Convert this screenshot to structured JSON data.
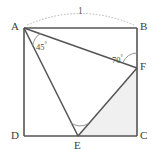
{
  "figure": {
    "type": "geometry-diagram",
    "background_color": "#ffffff",
    "stroke_color": "#555555",
    "thin_stroke_color": "#777777",
    "shade_color": "#f0f0f0",
    "square": {
      "name": "ABCD",
      "vertices": [
        {
          "id": "A",
          "label": "A",
          "x": 24,
          "y": 28
        },
        {
          "id": "B",
          "label": "B",
          "x": 137,
          "y": 28
        },
        {
          "id": "C",
          "label": "C",
          "x": 137,
          "y": 136
        },
        {
          "id": "D",
          "label": "D",
          "x": 24,
          "y": 136
        }
      ]
    },
    "points": [
      {
        "id": "F",
        "label": "F",
        "x": 137,
        "y": 68,
        "on_edge": "BC"
      },
      {
        "id": "E",
        "label": "E",
        "x": 78,
        "y": 136,
        "on_edge": "DC"
      }
    ],
    "segments": [
      {
        "id": "AB",
        "from": "A",
        "to": "B",
        "weight": "heavy"
      },
      {
        "id": "BC",
        "from": "B",
        "to": "C",
        "weight": "heavy"
      },
      {
        "id": "CD",
        "from": "C",
        "to": "D",
        "weight": "heavy"
      },
      {
        "id": "DA",
        "from": "D",
        "to": "A",
        "weight": "heavy"
      },
      {
        "id": "AF",
        "from": "A",
        "to": "F",
        "weight": "heavy"
      },
      {
        "id": "AE",
        "from": "A",
        "to": "E",
        "weight": "heavy"
      },
      {
        "id": "EF",
        "from": "E",
        "to": "F",
        "weight": "heavy"
      }
    ],
    "shaded_region": {
      "id": "EFC",
      "vertices": [
        "E",
        "F",
        "C"
      ],
      "fill": "#f0f0f0"
    },
    "angles": [
      {
        "id": "angle-at-A",
        "vertex": "A",
        "label": "45",
        "degree_symbol": "°",
        "label_x": 36,
        "label_y": 41,
        "value": 45,
        "between": [
          "AF",
          "AE"
        ]
      },
      {
        "id": "angle-at-F",
        "vertex": "F",
        "label": "70",
        "degree_symbol": "°",
        "label_x": 112,
        "label_y": 54,
        "value": 70,
        "between": [
          "FB",
          "FA"
        ]
      },
      {
        "id": "angle-at-E",
        "vertex": "E",
        "label": "",
        "degree_symbol": "",
        "label_x": 78,
        "label_y": 124,
        "value": null,
        "between": [
          "EA",
          "EF"
        ]
      }
    ],
    "measurements": [
      {
        "id": "length-AB",
        "label": "1",
        "label_x": 78,
        "label_y": 8,
        "arc_from": "A",
        "arc_to": "B",
        "style": "dotted-arc"
      }
    ],
    "vertex_labels": [
      {
        "id": "label-A",
        "text": "A",
        "x": 11,
        "y": 21
      },
      {
        "id": "label-B",
        "text": "B",
        "x": 140,
        "y": 21
      },
      {
        "id": "label-C",
        "text": "C",
        "x": 140,
        "y": 130
      },
      {
        "id": "label-D",
        "text": "D",
        "x": 11,
        "y": 130
      },
      {
        "id": "label-E",
        "text": "E",
        "x": 74,
        "y": 140
      },
      {
        "id": "label-F",
        "text": "F",
        "x": 140,
        "y": 61
      }
    ]
  }
}
